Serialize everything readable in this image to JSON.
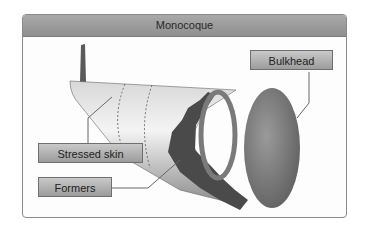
{
  "diagram": {
    "title": "Monocoque",
    "labels": {
      "bulkhead": "Bulkhead",
      "stressed_skin": "Stressed skin",
      "formers": "Formers"
    }
  }
}
